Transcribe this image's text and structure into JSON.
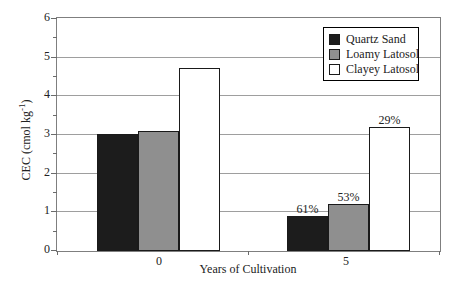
{
  "chart_data": {
    "type": "bar",
    "title": "",
    "xlabel": "Years of Cultivation",
    "ylabel": {
      "prefix": "CEC (cmol kg",
      "superscript": "-1",
      "suffix": ")"
    },
    "categories": [
      "0",
      "5"
    ],
    "yticks": [
      "6",
      "5",
      "4",
      "3",
      "2",
      "1",
      "0"
    ],
    "ylim": [
      0,
      6
    ],
    "ytick_interval": 1,
    "minor_ytick_interval": 0.5,
    "grid": "horizontal",
    "legend_position": "top-right-inside",
    "series": [
      {
        "name": "Quartz Sand",
        "color": "#1c1c1c",
        "values": [
          3.0,
          0.9
        ],
        "bar_labels": [
          "",
          "61%"
        ]
      },
      {
        "name": "Loamy Latosol",
        "color": "#8f8f8f",
        "values": [
          3.1,
          1.2
        ],
        "bar_labels": [
          "",
          "53%"
        ]
      },
      {
        "name": "Clayey Latosol",
        "color": "#ffffff",
        "values": [
          4.7,
          3.2
        ],
        "bar_labels": [
          "",
          "29%"
        ]
      }
    ]
  },
  "colors": {
    "background": "#ffffff",
    "gridline": "#9e9e9e",
    "plot_border": "#7f7f7f",
    "bar_outline": "#1a1a1a",
    "legend_border": "#000000"
  }
}
